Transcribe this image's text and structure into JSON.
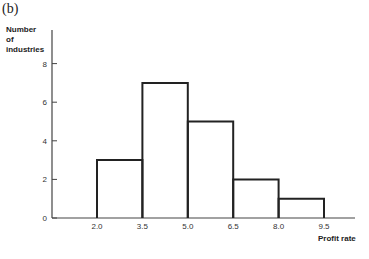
{
  "panel_label": "(b)",
  "chart_data": {
    "type": "bar",
    "subtype": "histogram",
    "title": "",
    "panel": "(b)",
    "xlabel": "Profit rate",
    "ylabel_lines": [
      "Number",
      "of",
      "industries"
    ],
    "ylabel": "Number of industries",
    "bins": [
      {
        "from": 2.0,
        "to": 3.5,
        "count": 3
      },
      {
        "from": 3.5,
        "to": 5.0,
        "count": 7
      },
      {
        "from": 5.0,
        "to": 6.5,
        "count": 5
      },
      {
        "from": 6.5,
        "to": 8.0,
        "count": 2
      },
      {
        "from": 8.0,
        "to": 9.5,
        "count": 1
      }
    ],
    "categories": [
      "2.0-3.5",
      "3.5-5.0",
      "5.0-6.5",
      "6.5-8.0",
      "8.0-9.5"
    ],
    "values": [
      3,
      7,
      5,
      2,
      1
    ],
    "x_ticks": [
      "2.0",
      "3.5",
      "5.0",
      "6.5",
      "8.0",
      "9.5"
    ],
    "y_ticks": [
      "0",
      "2",
      "4",
      "6",
      "8"
    ],
    "ylim": [
      0,
      10
    ],
    "grid": false,
    "legend": null
  }
}
